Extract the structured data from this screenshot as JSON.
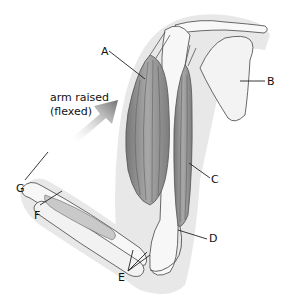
{
  "caption": {
    "line1": "arm raised",
    "line2": "(flexed)"
  },
  "labels": {
    "A": "A",
    "B": "B",
    "C": "C",
    "D": "D",
    "E": "E",
    "F": "F",
    "G": "G"
  },
  "colors": {
    "skin_silhouette": "#e6e6e6",
    "bone": "#f7f7f7",
    "muscle": "#8f8f8f",
    "muscle_light": "#b5b5b5",
    "arrow": "#7a7a7a",
    "outline": "#333333"
  }
}
